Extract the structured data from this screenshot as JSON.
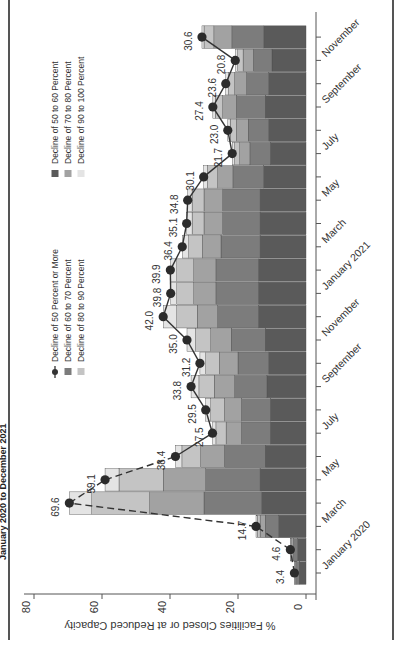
{
  "page": {
    "subtitle": "January 2020 to December 2021",
    "orientation_note": "figure rotated 90 degrees counter-clockwise"
  },
  "legend": {
    "items": [
      {
        "key": "total",
        "label": "Decline of 50 Percent or More",
        "style": "line-marker",
        "color": "#333333"
      },
      {
        "key": "s60_70",
        "label": "Decline of 60 to 70 Percent",
        "style": "square",
        "color": "#7c7c7c"
      },
      {
        "key": "s80_90",
        "label": "Decline of 80 to 90 Percent",
        "style": "square",
        "color": "#c4c4c4"
      },
      {
        "key": "s50_60",
        "label": "Decline of 50 to 60 Percent",
        "style": "square",
        "color": "#5a5a5a"
      },
      {
        "key": "s70_80",
        "label": "Decline of 70 to 80 Percent",
        "style": "square",
        "color": "#a2a2a2"
      },
      {
        "key": "s90_100",
        "label": "Decline of 90 to 100 Percent",
        "style": "square",
        "color": "#e4e4e4"
      }
    ]
  },
  "chart_data": {
    "type": "bar",
    "stacked": true,
    "title": "",
    "subtitle": "January 2020 to December 2021",
    "xlabel": "",
    "ylabel": "% Facilities Closed or at Reduced Capacity",
    "ylim": [
      0,
      80
    ],
    "yticks": [
      0,
      20,
      40,
      60,
      80
    ],
    "grid": false,
    "legend_position": "inside upper left",
    "x_tick_labels": [
      "January 2020",
      "March",
      "May",
      "July",
      "September",
      "November",
      "January 2021",
      "March",
      "May",
      "July",
      "September",
      "November"
    ],
    "categories": [
      "Jan 2020",
      "Feb 2020",
      "Mar 2020",
      "Apr 2020",
      "May 2020",
      "Jun 2020",
      "Jul 2020",
      "Aug 2020",
      "Sep 2020",
      "Oct 2020",
      "Nov 2020",
      "Dec 2020",
      "Jan 2021",
      "Feb 2021",
      "Mar 2021",
      "Apr 2021",
      "May 2021",
      "Jun 2021",
      "Jul 2021",
      "Aug 2021",
      "Sep 2021",
      "Oct 2021",
      "Nov 2021",
      "Dec 2021"
    ],
    "series": [
      {
        "name": "Decline of 50 to 60 Percent",
        "color": "#5a5a5a",
        "values": [
          2.0,
          2.5,
          8.0,
          13.0,
          13.5,
          12.0,
          10.5,
          10.5,
          11.5,
          11.0,
          12.0,
          14.0,
          14.0,
          14.0,
          13.5,
          13.5,
          13.5,
          12.5,
          10.5,
          11.0,
          12.0,
          11.0,
          10.0,
          12.4
        ]
      },
      {
        "name": "Decline of 60 to 70 Percent",
        "color": "#7c7c7c",
        "values": [
          0.8,
          1.2,
          4.0,
          17.0,
          16.0,
          12.0,
          8.5,
          8.5,
          9.5,
          9.0,
          10.0,
          12.0,
          12.5,
          12.5,
          11.5,
          11.0,
          11.0,
          9.0,
          6.0,
          6.0,
          8.5,
          6.5,
          5.5,
          9.4
        ]
      },
      {
        "name": "Decline of 70 to 80 Percent",
        "color": "#a2a2a2",
        "values": [
          0.3,
          0.5,
          1.5,
          16.0,
          12.5,
          7.0,
          4.5,
          5.0,
          6.0,
          5.5,
          6.0,
          6.0,
          6.5,
          6.5,
          5.5,
          5.5,
          5.5,
          4.5,
          3.0,
          3.5,
          4.0,
          3.5,
          3.0,
          5.3
        ]
      },
      {
        "name": "Decline of 80 to 90 Percent",
        "color": "#c4c4c4",
        "values": [
          0.2,
          0.3,
          0.8,
          17.0,
          13.0,
          5.5,
          3.0,
          4.0,
          4.5,
          4.0,
          4.5,
          6.0,
          5.0,
          5.0,
          4.0,
          3.5,
          3.5,
          3.0,
          1.5,
          1.8,
          2.2,
          1.8,
          1.6,
          2.9
        ]
      },
      {
        "name": "Decline of 90 to 100 Percent",
        "color": "#e4e4e4",
        "values": [
          0.1,
          0.1,
          0.4,
          6.6,
          4.1,
          1.9,
          1.0,
          1.5,
          2.3,
          1.7,
          2.5,
          4.0,
          1.8,
          1.9,
          1.9,
          1.6,
          1.3,
          1.1,
          0.7,
          0.7,
          0.7,
          0.8,
          0.7,
          0.6
        ]
      }
    ],
    "line": {
      "name": "Decline of 50 Percent or More",
      "style": "dashed 2020 (through Jun), solid thereafter",
      "values": [
        3.4,
        4.6,
        14.7,
        69.6,
        59.1,
        38.4,
        27.5,
        29.5,
        33.8,
        31.2,
        35.0,
        42.0,
        39.8,
        39.9,
        36.4,
        35.1,
        34.8,
        30.1,
        21.7,
        23.0,
        27.4,
        23.6,
        20.8,
        30.6
      ],
      "labels": [
        "3.4",
        "4.6",
        "14.7",
        "69.6",
        "59.1",
        "38.4",
        "27.5",
        "29.5",
        "33.8",
        "31.2",
        "35.0",
        "42.0",
        "39.8",
        "39.9",
        "36.4",
        "35.1",
        "34.8",
        "30.1",
        "21.7",
        "23.0",
        "27.4",
        "23.6",
        "20.8",
        "30.6"
      ]
    }
  }
}
